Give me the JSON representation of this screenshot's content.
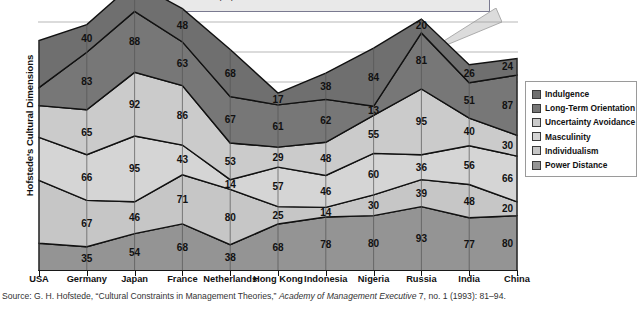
{
  "callout": {
    "text": "has a strong long-term orientation (87), it has a very weak individualistic orientation (20)."
  },
  "axis": {
    "y_title": "Hofstede's Cultural Dimensions"
  },
  "source": {
    "prefix": "Source: G. H. Hofstede, “Cultural Constraints in Management Theories,” ",
    "italic": "Academy of Management Executive",
    "suffix": " 7, no. 1 (1993): 81–94."
  },
  "legend": {
    "items": [
      {
        "label": "Indulgence",
        "color": "#6f6f6f"
      },
      {
        "label": "Long-Term Orientation",
        "color": "#777777"
      },
      {
        "label": "Uncertainty Avoidance",
        "color": "#cbcbcb"
      },
      {
        "label": "Masculinity",
        "color": "#d5d5d5"
      },
      {
        "label": "Individualism",
        "color": "#c6c6c6"
      },
      {
        "label": "Power Distance",
        "color": "#949494"
      }
    ]
  },
  "chart_data": {
    "type": "area",
    "title": "",
    "xlabel": "",
    "ylabel": "Hofstede's Cultural Dimensions",
    "grid": true,
    "legend_position": "right",
    "stacked": true,
    "categories": [
      "USA",
      "Germany",
      "Japan",
      "France",
      "Netherlands",
      "Hong Kong",
      "Indonesia",
      "Nigeria",
      "Russia",
      "India",
      "China"
    ],
    "series": [
      {
        "name": "Indulgence",
        "color": "#6f6f6f",
        "values": [
          68,
          40,
          42,
          48,
          68,
          17,
          38,
          84,
          20,
          26,
          24
        ]
      },
      {
        "name": "Long-Term Orientation",
        "color": "#777777",
        "values": [
          26,
          83,
          88,
          63,
          67,
          61,
          62,
          13,
          81,
          51,
          87
        ]
      },
      {
        "name": "Uncertainty Avoidance",
        "color": "#cbcbcb",
        "values": [
          46,
          65,
          92,
          86,
          53,
          29,
          48,
          55,
          95,
          40,
          30
        ]
      },
      {
        "name": "Masculinity",
        "color": "#d5d5d5",
        "values": [
          62,
          66,
          95,
          43,
          14,
          57,
          46,
          60,
          36,
          56,
          66
        ]
      },
      {
        "name": "Individualism",
        "color": "#c6c6c6",
        "values": [
          91,
          67,
          46,
          71,
          80,
          25,
          14,
          30,
          39,
          48,
          20
        ]
      },
      {
        "name": "Power Distance",
        "color": "#949494",
        "values": [
          40,
          35,
          54,
          68,
          38,
          68,
          78,
          80,
          93,
          77,
          80
        ]
      }
    ]
  }
}
